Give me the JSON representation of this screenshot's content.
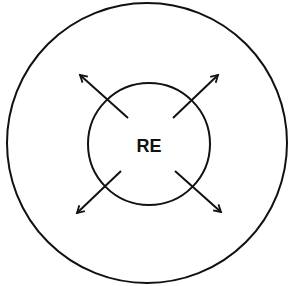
{
  "diagram": {
    "center_label": "RE",
    "outer_circle": {
      "cx": 147,
      "cy": 143,
      "r": 140
    },
    "inner_circle": {
      "cx": 149,
      "cy": 144,
      "r": 61
    },
    "arrows": [
      {
        "name": "arrow-up-left",
        "x1": 128,
        "y1": 118,
        "x2": 80,
        "y2": 75
      },
      {
        "name": "arrow-up-right",
        "x1": 173,
        "y1": 118,
        "x2": 218,
        "y2": 75
      },
      {
        "name": "arrow-down-left",
        "x1": 121,
        "y1": 171,
        "x2": 77,
        "y2": 213
      },
      {
        "name": "arrow-down-right",
        "x1": 175,
        "y1": 171,
        "x2": 221,
        "y2": 212
      }
    ],
    "stroke_color": "#111111"
  }
}
